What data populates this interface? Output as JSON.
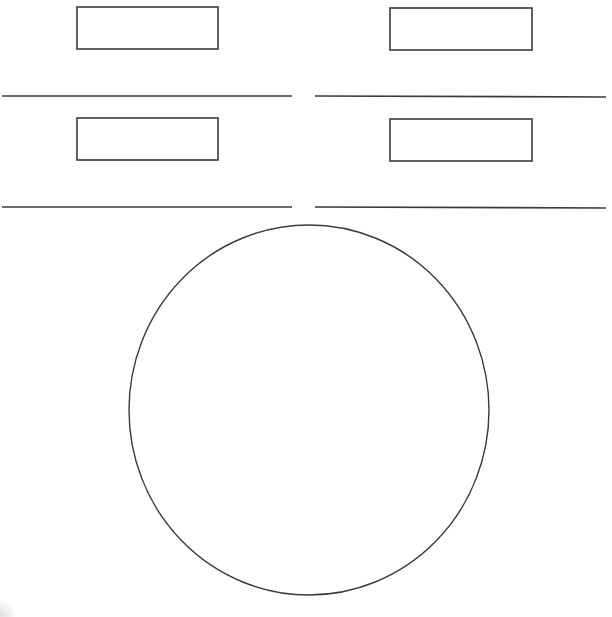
{
  "canvas": {
    "width": 612,
    "height": 617,
    "background": "#ffffff",
    "stroke_color": "#3a3a3a"
  },
  "rectangles": [
    {
      "id": "top-left-box",
      "x": 77,
      "y": 7,
      "width": 141,
      "height": 42
    },
    {
      "id": "top-right-box",
      "x": 390,
      "y": 8,
      "width": 142,
      "height": 42
    },
    {
      "id": "middle-left-box",
      "x": 77,
      "y": 118,
      "width": 141,
      "height": 42
    },
    {
      "id": "middle-right-box",
      "x": 390,
      "y": 119,
      "width": 142,
      "height": 42
    }
  ],
  "lines": [
    {
      "id": "upper-left-line",
      "x1": 2,
      "y1": 96,
      "x2": 292,
      "y2": 96
    },
    {
      "id": "upper-right-line",
      "x1": 315,
      "y1": 96,
      "x2": 606,
      "y2": 97
    },
    {
      "id": "lower-left-line",
      "x1": 2,
      "y1": 207,
      "x2": 292,
      "y2": 207
    },
    {
      "id": "lower-right-line",
      "x1": 315,
      "y1": 207,
      "x2": 606,
      "y2": 208
    }
  ],
  "circle": {
    "id": "large-circle",
    "cx": 309,
    "cy": 410,
    "rx": 180,
    "ry": 185
  }
}
